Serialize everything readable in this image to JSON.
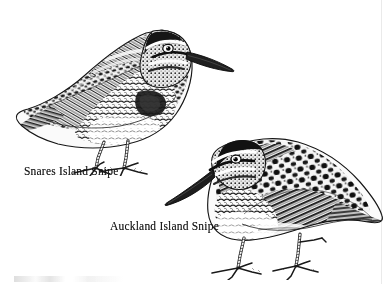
{
  "plate": {
    "title": "Snipe Illustration Plate",
    "medium": "pen-and-ink scientific illustration",
    "background_color": "#ffffff",
    "ink_color": "#1b1b1b",
    "width": 386,
    "height": 284
  },
  "figures": [
    {
      "id": "snares-island-snipe",
      "caption": "Snares Island Snipe",
      "facing": "right",
      "position": "upper-left",
      "bbox": [
        12,
        12,
        228,
        172
      ]
    },
    {
      "id": "auckland-island-snipe",
      "caption": "Auckland Island Snipe",
      "facing": "left",
      "position": "lower-right",
      "bbox": [
        160,
        133,
        380,
        276
      ]
    }
  ],
  "captions": {
    "snares": "Snares Island Snipe",
    "auckland": "Auckland Island Snipe"
  }
}
